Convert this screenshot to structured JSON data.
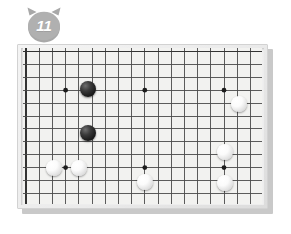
{
  "badge": {
    "icon": "cat-head-badge-icon",
    "label": "11",
    "fill_color": "#a8a8a8",
    "text_color": "#ffffff"
  },
  "board": {
    "name": "go-board",
    "frame_color": "#ebebeb",
    "surface_color": "#f2f2f0",
    "line_color": "#4a4a4a",
    "border_line_color": "#333333",
    "shadow_color": "#c9c9c9",
    "columns": 19,
    "rows": 13,
    "cell_width": 13.2,
    "cell_height": 12.9,
    "origin_x": 3.0,
    "origin_y": 3.5,
    "stone_radius": 8,
    "star_point_radius": 2.4,
    "star_points": [
      {
        "col": 3,
        "row": 3
      },
      {
        "col": 9,
        "row": 3
      },
      {
        "col": 15,
        "row": 3
      },
      {
        "col": 3,
        "row": 9
      },
      {
        "col": 9,
        "row": 9
      },
      {
        "col": 15,
        "row": 9
      }
    ],
    "stones": [
      {
        "col": 4.7,
        "row": 2.9,
        "color": "black",
        "name": "black-stone"
      },
      {
        "col": 4.7,
        "row": 6.3,
        "color": "black",
        "name": "black-stone"
      },
      {
        "col": 16.1,
        "row": 4.1,
        "color": "white",
        "name": "white-stone"
      },
      {
        "col": 15.1,
        "row": 7.8,
        "color": "white",
        "name": "white-stone"
      },
      {
        "col": 15.1,
        "row": 10.2,
        "color": "white",
        "name": "white-stone"
      },
      {
        "col": 2.1,
        "row": 9.0,
        "color": "white",
        "name": "white-stone"
      },
      {
        "col": 4.0,
        "row": 9.0,
        "color": "white",
        "name": "white-stone"
      },
      {
        "col": 9.0,
        "row": 10.1,
        "color": "white",
        "name": "white-stone"
      }
    ]
  }
}
